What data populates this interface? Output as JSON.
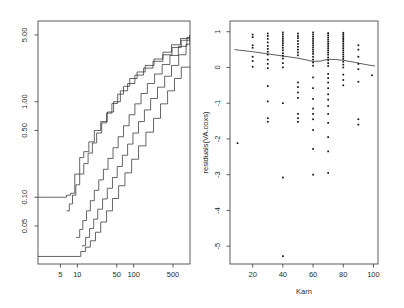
{
  "figure": {
    "type": "multi-panel-statistical-plot",
    "background": "#ffffff",
    "ink": "#333333",
    "width": 404,
    "height": 308
  },
  "chart_data": [
    {
      "type": "line",
      "panel": "left",
      "title": "",
      "xlabel": "",
      "ylabel": "",
      "xscale": "log",
      "yscale": "log",
      "xlim": [
        2,
        1000
      ],
      "ylim": [
        0.02,
        7
      ],
      "xticks": [
        5,
        10,
        50,
        100,
        500
      ],
      "xticklabels": [
        "5",
        "10",
        "50",
        "100",
        "500"
      ],
      "yticks": [
        0.05,
        0.1,
        0.5,
        1.0,
        5.0
      ],
      "yticklabels": [
        "0.05",
        "0.10",
        "0.50",
        "1.00",
        "5.00"
      ],
      "grid": false,
      "legend": "none",
      "description": "Step functions: estimated cumulative hazard with upper and lower confidence bands, plus smooth reference curves, on log-log axes",
      "series": [
        {
          "name": "upper-confidence-band",
          "style": "step",
          "x": [
            2,
            3.2,
            4.2,
            5.2,
            6.4,
            7.6,
            9,
            11,
            13,
            16,
            20,
            26,
            34,
            44,
            58,
            78,
            105,
            150,
            220,
            330,
            480,
            700,
            1000
          ],
          "y": [
            0.1,
            0.1,
            0.1,
            0.1,
            0.105,
            0.11,
            0.175,
            0.26,
            0.3,
            0.38,
            0.5,
            0.62,
            0.78,
            1.0,
            1.3,
            1.55,
            1.9,
            2.25,
            2.65,
            3.1,
            3.7,
            4.4,
            5.0
          ]
        },
        {
          "name": "upper-step-curve",
          "style": "step",
          "x": [
            6.4,
            7.2,
            8.2,
            9.4,
            11,
            13,
            15.5,
            18.5,
            22,
            27,
            33,
            41,
            52,
            66,
            85,
            115,
            160,
            230,
            330,
            470,
            680,
            1000
          ],
          "y": [
            0.072,
            0.085,
            0.105,
            0.135,
            0.175,
            0.225,
            0.29,
            0.37,
            0.47,
            0.6,
            0.76,
            0.96,
            1.2,
            1.45,
            1.75,
            2.05,
            2.4,
            2.8,
            3.3,
            3.95,
            4.6,
            5.0
          ]
        },
        {
          "name": "central-estimate-step",
          "style": "step",
          "x": [
            9.5,
            11,
            12.5,
            14.5,
            17,
            20,
            24,
            29,
            35,
            43,
            53,
            66,
            83,
            105,
            135,
            175,
            235,
            320,
            440,
            620,
            880,
            1000
          ],
          "y": [
            0.038,
            0.046,
            0.057,
            0.072,
            0.092,
            0.118,
            0.152,
            0.196,
            0.255,
            0.33,
            0.43,
            0.56,
            0.73,
            0.95,
            1.22,
            1.55,
            1.95,
            2.45,
            3.05,
            3.8,
            4.7,
            5.0
          ]
        },
        {
          "name": "lower-step-curve",
          "style": "step",
          "x": [
            12,
            14,
            16.5,
            19.5,
            23,
            28,
            34,
            42,
            51,
            63,
            78,
            97,
            122,
            155,
            200,
            265,
            355,
            470,
            630,
            850,
            1000
          ],
          "y": [
            0.031,
            0.038,
            0.047,
            0.059,
            0.075,
            0.096,
            0.124,
            0.161,
            0.21,
            0.275,
            0.36,
            0.47,
            0.62,
            0.82,
            1.08,
            1.42,
            1.85,
            2.4,
            3.1,
            4.0,
            4.85
          ]
        },
        {
          "name": "lower-confidence-band",
          "style": "step",
          "x": [
            2,
            9.5,
            11.5,
            14,
            17,
            21,
            26,
            33,
            42,
            54,
            70,
            92,
            122,
            165,
            225,
            300,
            400,
            530,
            700,
            1000
          ],
          "y": [
            0.024,
            0.024,
            0.027,
            0.03,
            0.035,
            0.043,
            0.055,
            0.072,
            0.097,
            0.132,
            0.18,
            0.25,
            0.345,
            0.48,
            0.67,
            0.95,
            1.3,
            1.75,
            2.3,
            2.3
          ]
        }
      ]
    },
    {
      "type": "scatter",
      "panel": "right",
      "title": "",
      "xlabel": "Karn",
      "ylabel": "residuals(VA.coxs)",
      "xscale": "linear",
      "yscale": "linear",
      "xlim": [
        5,
        103
      ],
      "ylim": [
        -5.5,
        1.3
      ],
      "xticks": [
        20,
        40,
        60,
        80,
        100
      ],
      "xticklabels": [
        "20",
        "40",
        "60",
        "80",
        "100"
      ],
      "yticks": [
        1,
        0,
        -1,
        -2,
        -3,
        -4,
        -5
      ],
      "yticklabels": [
        "1",
        "0",
        "-1",
        "-2",
        "-3",
        "-4",
        "-5"
      ],
      "grid": false,
      "legend": "none",
      "marker": "filled-square",
      "description": "Martingale/deviance residuals from a Cox proportional hazards model plotted against Karnofsky performance score, with a LOWESS smoother overlay",
      "points": [
        [
          10,
          -2.12
        ],
        [
          20,
          0.92
        ],
        [
          20,
          0.85
        ],
        [
          20,
          0.62
        ],
        [
          20,
          0.55
        ],
        [
          20,
          0.3
        ],
        [
          20,
          0.18
        ],
        [
          20,
          0.02
        ],
        [
          30,
          0.95
        ],
        [
          30,
          0.88
        ],
        [
          30,
          0.8
        ],
        [
          30,
          0.7
        ],
        [
          30,
          0.6
        ],
        [
          30,
          0.52
        ],
        [
          30,
          0.44
        ],
        [
          30,
          0.36
        ],
        [
          30,
          0.22
        ],
        [
          30,
          0.1
        ],
        [
          30,
          -0.02
        ],
        [
          30,
          -0.52
        ],
        [
          30,
          -0.95
        ],
        [
          30,
          -1.42
        ],
        [
          30,
          -1.52
        ],
        [
          40,
          0.98
        ],
        [
          40,
          0.92
        ],
        [
          40,
          0.86
        ],
        [
          40,
          0.8
        ],
        [
          40,
          0.74
        ],
        [
          40,
          0.68
        ],
        [
          40,
          0.62
        ],
        [
          40,
          0.55
        ],
        [
          40,
          0.48
        ],
        [
          40,
          0.4
        ],
        [
          40,
          0.33
        ],
        [
          40,
          0.25
        ],
        [
          40,
          0.12
        ],
        [
          40,
          0.0
        ],
        [
          40,
          -1.0
        ],
        [
          40,
          -3.08
        ],
        [
          40,
          -5.28
        ],
        [
          50,
          0.95
        ],
        [
          50,
          0.88
        ],
        [
          50,
          0.82
        ],
        [
          50,
          0.74
        ],
        [
          50,
          0.66
        ],
        [
          50,
          0.58
        ],
        [
          50,
          0.5
        ],
        [
          50,
          0.42
        ],
        [
          50,
          0.34
        ],
        [
          50,
          -0.42
        ],
        [
          50,
          -0.55
        ],
        [
          50,
          -0.7
        ],
        [
          50,
          -0.85
        ],
        [
          50,
          -1.3
        ],
        [
          50,
          -1.42
        ],
        [
          50,
          -1.52
        ],
        [
          60,
          0.98
        ],
        [
          60,
          0.92
        ],
        [
          60,
          0.86
        ],
        [
          60,
          0.8
        ],
        [
          60,
          0.74
        ],
        [
          60,
          0.68
        ],
        [
          60,
          0.62
        ],
        [
          60,
          0.56
        ],
        [
          60,
          0.5
        ],
        [
          60,
          0.44
        ],
        [
          60,
          0.38
        ],
        [
          60,
          0.3
        ],
        [
          60,
          0.22
        ],
        [
          60,
          0.14
        ],
        [
          60,
          0.05
        ],
        [
          60,
          -0.28
        ],
        [
          60,
          -0.58
        ],
        [
          60,
          -0.88
        ],
        [
          60,
          -1.15
        ],
        [
          60,
          -1.3
        ],
        [
          60,
          -1.45
        ],
        [
          60,
          -1.75
        ],
        [
          60,
          -2.28
        ],
        [
          60,
          -3.0
        ],
        [
          70,
          0.96
        ],
        [
          70,
          0.9
        ],
        [
          70,
          0.84
        ],
        [
          70,
          0.78
        ],
        [
          70,
          0.72
        ],
        [
          70,
          0.66
        ],
        [
          70,
          0.6
        ],
        [
          70,
          0.54
        ],
        [
          70,
          0.48
        ],
        [
          70,
          0.42
        ],
        [
          70,
          0.36
        ],
        [
          70,
          0.28
        ],
        [
          70,
          0.2
        ],
        [
          70,
          0.12
        ],
        [
          70,
          0.04
        ],
        [
          70,
          -0.18
        ],
        [
          70,
          -0.3
        ],
        [
          70,
          -0.42
        ],
        [
          70,
          -0.58
        ],
        [
          70,
          -0.75
        ],
        [
          70,
          -0.9
        ],
        [
          70,
          -1.08
        ],
        [
          70,
          -1.3
        ],
        [
          70,
          -1.55
        ],
        [
          70,
          -1.95
        ],
        [
          70,
          -2.35
        ],
        [
          70,
          -2.95
        ],
        [
          80,
          0.97
        ],
        [
          80,
          0.92
        ],
        [
          80,
          0.87
        ],
        [
          80,
          0.82
        ],
        [
          80,
          0.77
        ],
        [
          80,
          0.72
        ],
        [
          80,
          0.66
        ],
        [
          80,
          0.6
        ],
        [
          80,
          0.54
        ],
        [
          80,
          0.48
        ],
        [
          80,
          0.42
        ],
        [
          80,
          0.36
        ],
        [
          80,
          0.3
        ],
        [
          80,
          0.24
        ],
        [
          80,
          0.16
        ],
        [
          80,
          0.08
        ],
        [
          80,
          0.0
        ],
        [
          80,
          -0.2
        ],
        [
          80,
          -0.35
        ],
        [
          80,
          -0.5
        ],
        [
          90,
          0.62
        ],
        [
          90,
          0.5
        ],
        [
          90,
          0.3
        ],
        [
          90,
          0.1
        ],
        [
          90,
          -0.05
        ],
        [
          90,
          -0.4
        ],
        [
          90,
          -1.45
        ],
        [
          90,
          -1.6
        ],
        [
          99,
          -0.22
        ]
      ],
      "smoother": {
        "name": "lowess-smoother",
        "x": [
          8,
          20,
          30,
          40,
          50,
          60,
          65,
          70,
          75,
          80,
          88,
          95,
          101
        ],
        "y": [
          0.5,
          0.44,
          0.38,
          0.32,
          0.26,
          0.17,
          0.18,
          0.23,
          0.22,
          0.2,
          0.14,
          0.08,
          0.04
        ]
      }
    }
  ]
}
